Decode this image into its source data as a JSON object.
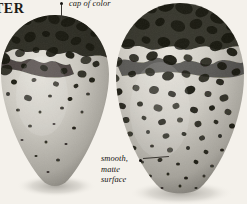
{
  "plate": {
    "header_title": "TER",
    "background_color": "#f4f1eb",
    "shell_base_color": "#c9c6be",
    "shell_highlight_color": "#e3e0d8",
    "shell_shadow_color": "#8e8b83",
    "marking_color": "#14120f",
    "caption_color": "#15130f"
  },
  "annotations": [
    {
      "id": "cap-of-color",
      "text": "cap of color",
      "dot_x": 60,
      "dot_y": 2,
      "label_x": 69,
      "label_y": -1
    },
    {
      "id": "smooth-matte-surface",
      "lines": [
        "smooth,",
        "matte",
        "surface"
      ],
      "dot_x": 139,
      "dot_y": 159,
      "label_x": 101,
      "label_y": 154
    }
  ],
  "specimens": [
    {
      "id": "egg-left",
      "name": "pyriform-egg-left",
      "shape": "pyriform",
      "center_x": 55,
      "top_y": 15,
      "bottom_y": 188,
      "width": 108,
      "height": 173,
      "marking_pattern": "dense-cap-blotches-top-sparse-spots-below",
      "marking_coverage_percent": 38
    },
    {
      "id": "egg-right",
      "name": "pyriform-egg-right",
      "shape": "pyriform-broad",
      "center_x": 180,
      "top_y": 3,
      "bottom_y": 194,
      "width": 128,
      "height": 191,
      "marking_pattern": "heavy-blotches-overall-densest-top",
      "marking_coverage_percent": 55
    }
  ],
  "marks_left": [
    [
      -4,
      30,
      16,
      11,
      18
    ],
    [
      12,
      26,
      13,
      9,
      -22
    ],
    [
      26,
      21,
      11,
      8,
      12
    ],
    [
      40,
      18,
      14,
      9,
      -10
    ],
    [
      54,
      19,
      12,
      10,
      30
    ],
    [
      68,
      22,
      15,
      9,
      -18
    ],
    [
      82,
      27,
      12,
      8,
      14
    ],
    [
      95,
      33,
      10,
      7,
      -25
    ],
    [
      -2,
      45,
      19,
      13,
      -12
    ],
    [
      16,
      40,
      9,
      7,
      22
    ],
    [
      30,
      37,
      12,
      10,
      -30
    ],
    [
      46,
      34,
      8,
      6,
      10
    ],
    [
      62,
      36,
      14,
      10,
      16
    ],
    [
      76,
      41,
      11,
      8,
      -20
    ],
    [
      90,
      47,
      9,
      7,
      25
    ],
    [
      2,
      58,
      17,
      12,
      20
    ],
    [
      20,
      53,
      10,
      8,
      -15
    ],
    [
      36,
      50,
      7,
      6,
      8
    ],
    [
      52,
      52,
      13,
      9,
      -28
    ],
    [
      70,
      55,
      9,
      7,
      18
    ],
    [
      86,
      60,
      11,
      8,
      -12
    ],
    [
      6,
      70,
      13,
      10,
      -20
    ],
    [
      24,
      66,
      6,
      5,
      12
    ],
    [
      44,
      68,
      8,
      6,
      24
    ],
    [
      64,
      71,
      7,
      6,
      -16
    ],
    [
      82,
      74,
      9,
      7,
      10
    ],
    [
      96,
      64,
      7,
      6,
      -22
    ],
    [
      14,
      82,
      6,
      5,
      15
    ],
    [
      34,
      80,
      5,
      4,
      -10
    ],
    [
      56,
      84,
      6,
      5,
      20
    ],
    [
      76,
      86,
      5,
      4,
      -18
    ],
    [
      92,
      80,
      6,
      5,
      12
    ],
    [
      8,
      94,
      4,
      4,
      0
    ],
    [
      28,
      98,
      8,
      6,
      18
    ],
    [
      50,
      96,
      4,
      3,
      0
    ],
    [
      70,
      99,
      5,
      4,
      -14
    ],
    [
      88,
      94,
      4,
      3,
      0
    ],
    [
      18,
      110,
      4,
      3,
      0
    ],
    [
      40,
      112,
      3,
      3,
      0
    ],
    [
      62,
      108,
      4,
      3,
      0
    ],
    [
      82,
      112,
      3,
      3,
      0
    ],
    [
      30,
      126,
      4,
      3,
      0
    ],
    [
      54,
      124,
      3,
      2,
      0
    ],
    [
      74,
      128,
      4,
      3,
      0
    ],
    [
      22,
      140,
      3,
      2,
      0
    ],
    [
      46,
      142,
      3,
      3,
      0
    ],
    [
      66,
      144,
      3,
      2,
      0
    ],
    [
      36,
      156,
      3,
      2,
      0
    ],
    [
      58,
      160,
      4,
      3,
      0
    ],
    [
      48,
      172,
      3,
      2,
      0
    ]
  ],
  "marks_right": [
    [
      116,
      18,
      15,
      11,
      18
    ],
    [
      132,
      12,
      17,
      12,
      -20
    ],
    [
      150,
      8,
      14,
      10,
      25
    ],
    [
      166,
      6,
      16,
      11,
      -12
    ],
    [
      184,
      8,
      18,
      12,
      16
    ],
    [
      202,
      12,
      14,
      10,
      -24
    ],
    [
      218,
      18,
      16,
      11,
      14
    ],
    [
      232,
      26,
      12,
      9,
      -18
    ],
    [
      110,
      34,
      13,
      10,
      22
    ],
    [
      126,
      28,
      11,
      8,
      -14
    ],
    [
      142,
      24,
      16,
      11,
      12
    ],
    [
      160,
      22,
      10,
      8,
      -28
    ],
    [
      178,
      26,
      15,
      11,
      20
    ],
    [
      196,
      24,
      13,
      10,
      -16
    ],
    [
      212,
      30,
      11,
      8,
      10
    ],
    [
      228,
      38,
      14,
      10,
      -22
    ],
    [
      112,
      48,
      12,
      9,
      18
    ],
    [
      128,
      44,
      14,
      10,
      -12
    ],
    [
      146,
      40,
      9,
      7,
      24
    ],
    [
      164,
      42,
      13,
      10,
      14
    ],
    [
      182,
      44,
      16,
      11,
      -20
    ],
    [
      200,
      40,
      10,
      8,
      12
    ],
    [
      216,
      46,
      13,
      10,
      -16
    ],
    [
      232,
      52,
      11,
      8,
      20
    ],
    [
      116,
      62,
      13,
      10,
      -18
    ],
    [
      134,
      58,
      10,
      8,
      16
    ],
    [
      152,
      56,
      12,
      9,
      -22
    ],
    [
      170,
      60,
      14,
      10,
      12
    ],
    [
      188,
      58,
      9,
      7,
      24
    ],
    [
      206,
      62,
      12,
      9,
      -14
    ],
    [
      222,
      66,
      10,
      8,
      18
    ],
    [
      236,
      72,
      9,
      7,
      -20
    ],
    [
      114,
      78,
      11,
      8,
      14
    ],
    [
      132,
      74,
      8,
      6,
      -16
    ],
    [
      150,
      72,
      10,
      8,
      20
    ],
    [
      168,
      76,
      12,
      9,
      -12
    ],
    [
      186,
      74,
      9,
      7,
      22
    ],
    [
      204,
      78,
      11,
      8,
      -18
    ],
    [
      220,
      82,
      8,
      6,
      14
    ],
    [
      118,
      92,
      9,
      7,
      -20
    ],
    [
      136,
      88,
      7,
      6,
      16
    ],
    [
      154,
      90,
      10,
      8,
      -14
    ],
    [
      172,
      94,
      8,
      6,
      18
    ],
    [
      190,
      90,
      11,
      8,
      -22
    ],
    [
      208,
      94,
      7,
      6,
      12
    ],
    [
      224,
      98,
      9,
      7,
      -16
    ],
    [
      122,
      106,
      8,
      6,
      20
    ],
    [
      140,
      104,
      6,
      5,
      -12
    ],
    [
      158,
      108,
      9,
      7,
      16
    ],
    [
      176,
      106,
      7,
      6,
      -20
    ],
    [
      194,
      110,
      8,
      6,
      14
    ],
    [
      212,
      108,
      6,
      5,
      -18
    ],
    [
      228,
      112,
      7,
      6,
      22
    ],
    [
      126,
      120,
      7,
      6,
      -14
    ],
    [
      144,
      118,
      5,
      4,
      18
    ],
    [
      162,
      122,
      8,
      6,
      -20
    ],
    [
      180,
      120,
      6,
      5,
      12
    ],
    [
      198,
      124,
      7,
      6,
      -16
    ],
    [
      216,
      122,
      5,
      4,
      20
    ],
    [
      232,
      126,
      6,
      5,
      -12
    ],
    [
      130,
      134,
      6,
      5,
      16
    ],
    [
      148,
      132,
      4,
      4,
      0
    ],
    [
      166,
      136,
      7,
      5,
      -18
    ],
    [
      184,
      134,
      5,
      4,
      14
    ],
    [
      202,
      138,
      6,
      5,
      -22
    ],
    [
      220,
      136,
      4,
      4,
      0
    ],
    [
      134,
      148,
      5,
      4,
      18
    ],
    [
      152,
      146,
      4,
      3,
      0
    ],
    [
      170,
      150,
      6,
      5,
      -14
    ],
    [
      188,
      148,
      4,
      4,
      0
    ],
    [
      206,
      152,
      5,
      4,
      20
    ],
    [
      222,
      150,
      4,
      3,
      0
    ],
    [
      142,
      162,
      4,
      3,
      0
    ],
    [
      160,
      160,
      5,
      4,
      -16
    ],
    [
      178,
      164,
      4,
      3,
      0
    ],
    [
      196,
      162,
      5,
      4,
      18
    ],
    [
      212,
      166,
      4,
      3,
      0
    ],
    [
      150,
      176,
      4,
      3,
      0
    ],
    [
      168,
      174,
      3,
      3,
      0
    ],
    [
      186,
      178,
      4,
      3,
      0
    ],
    [
      204,
      176,
      3,
      3,
      0
    ],
    [
      162,
      188,
      3,
      2,
      0
    ],
    [
      180,
      186,
      3,
      3,
      0
    ],
    [
      196,
      188,
      3,
      2,
      0
    ]
  ]
}
